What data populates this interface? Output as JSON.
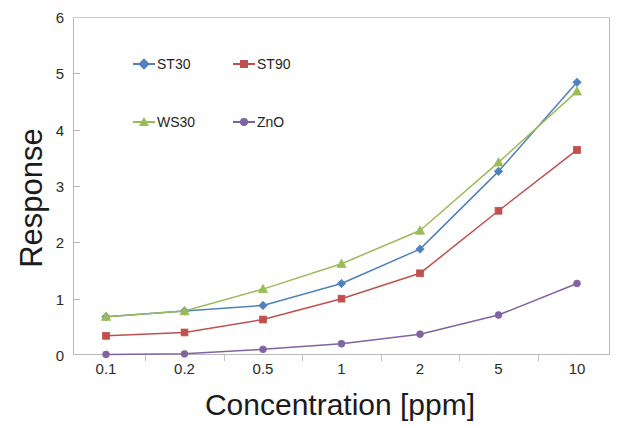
{
  "chart_data": {
    "type": "line",
    "title": "",
    "xlabel": "Concentration [ppm]",
    "ylabel": "Response",
    "categories": [
      "0.1",
      "0.2",
      "0.5",
      "1",
      "2",
      "5",
      "10"
    ],
    "x_scale": "category (log-spaced concentration values in ppm)",
    "ylim": [
      0,
      6
    ],
    "yticks": [
      0,
      1,
      2,
      3,
      4,
      5,
      6
    ],
    "grid": false,
    "legend_position": "upper-left-inside",
    "series": [
      {
        "name": "ST30",
        "color": "#4f81bd",
        "marker": "diamond",
        "values": [
          0.68,
          0.78,
          0.88,
          1.27,
          1.88,
          3.26,
          4.84
        ]
      },
      {
        "name": "ST90",
        "color": "#c0504d",
        "marker": "square",
        "values": [
          0.34,
          0.4,
          0.63,
          1.0,
          1.45,
          2.56,
          3.64
        ]
      },
      {
        "name": "WS30",
        "color": "#9bbb59",
        "marker": "triangle",
        "values": [
          0.68,
          0.78,
          1.17,
          1.62,
          2.21,
          3.42,
          4.68
        ]
      },
      {
        "name": "ZnO",
        "color": "#8064a2",
        "marker": "circle",
        "values": [
          0.01,
          0.02,
          0.1,
          0.2,
          0.37,
          0.71,
          1.27
        ]
      }
    ]
  },
  "axes": {
    "y_tick_labels": [
      "0",
      "1",
      "2",
      "3",
      "4",
      "5",
      "6"
    ],
    "x_tick_labels": [
      "0.1",
      "0.2",
      "0.5",
      "1",
      "2",
      "5",
      "10"
    ],
    "y_title": "Response",
    "x_title": "Concentration [ppm]"
  },
  "legend": {
    "entries": [
      {
        "label": "ST30",
        "color": "#4f81bd",
        "marker": "diamond"
      },
      {
        "label": "ST90",
        "color": "#c0504d",
        "marker": "square"
      },
      {
        "label": "WS30",
        "color": "#9bbb59",
        "marker": "triangle"
      },
      {
        "label": "ZnO",
        "color": "#8064a2",
        "marker": "circle"
      }
    ]
  },
  "colors": {
    "frame": "#b9b9b9",
    "text": "#1f1f1f",
    "background": "#ffffff"
  }
}
